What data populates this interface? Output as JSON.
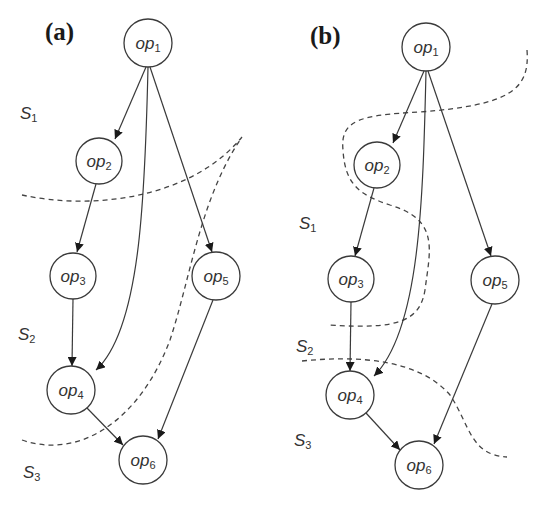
{
  "figure": {
    "panels": [
      {
        "label": "(a)",
        "nodes": [
          {
            "id": "op1",
            "base": "op",
            "sub": "1"
          },
          {
            "id": "op2",
            "base": "op",
            "sub": "2"
          },
          {
            "id": "op3",
            "base": "op",
            "sub": "3"
          },
          {
            "id": "op4",
            "base": "op",
            "sub": "4"
          },
          {
            "id": "op5",
            "base": "op",
            "sub": "5"
          },
          {
            "id": "op6",
            "base": "op",
            "sub": "6"
          }
        ],
        "edges": [
          [
            "op1",
            "op2"
          ],
          [
            "op1",
            "op4"
          ],
          [
            "op1",
            "op5"
          ],
          [
            "op2",
            "op3"
          ],
          [
            "op3",
            "op4"
          ],
          [
            "op4",
            "op6"
          ],
          [
            "op5",
            "op6"
          ]
        ],
        "stages": [
          {
            "base": "S",
            "sub": "1"
          },
          {
            "base": "S",
            "sub": "2"
          },
          {
            "base": "S",
            "sub": "3"
          }
        ]
      },
      {
        "label": "(b)",
        "nodes": [
          {
            "id": "op1",
            "base": "op",
            "sub": "1"
          },
          {
            "id": "op2",
            "base": "op",
            "sub": "2"
          },
          {
            "id": "op3",
            "base": "op",
            "sub": "3"
          },
          {
            "id": "op4",
            "base": "op",
            "sub": "4"
          },
          {
            "id": "op5",
            "base": "op",
            "sub": "5"
          },
          {
            "id": "op6",
            "base": "op",
            "sub": "6"
          }
        ],
        "edges": [
          [
            "op1",
            "op2"
          ],
          [
            "op1",
            "op4"
          ],
          [
            "op1",
            "op5"
          ],
          [
            "op2",
            "op3"
          ],
          [
            "op3",
            "op4"
          ],
          [
            "op4",
            "op6"
          ],
          [
            "op5",
            "op6"
          ]
        ],
        "stages": [
          {
            "base": "S",
            "sub": "1"
          },
          {
            "base": "S",
            "sub": "2"
          },
          {
            "base": "S",
            "sub": "3"
          }
        ]
      }
    ]
  }
}
